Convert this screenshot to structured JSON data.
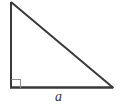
{
  "figure": {
    "name": "right-triangle",
    "type": "geometry-diagram",
    "background_color": "#ffffff",
    "stroke_color": "#3a3a3a",
    "stroke_width": 2,
    "vertices": {
      "apex_top_left": {
        "x": 11,
        "y": 2
      },
      "right_angle_bottom_left": {
        "x": 11,
        "y": 88
      },
      "bottom_right": {
        "x": 113,
        "y": 88
      }
    },
    "edges": [
      {
        "name": "vertical-leg",
        "from": "apex_top_left",
        "to": "right_angle_bottom_left",
        "label": ""
      },
      {
        "name": "horizontal-leg",
        "from": "right_angle_bottom_left",
        "to": "bottom_right",
        "label": "a"
      },
      {
        "name": "hypotenuse",
        "from": "apex_top_left",
        "to": "bottom_right",
        "label": ""
      }
    ],
    "right_angle_marker": {
      "name": "right-angle-square",
      "vertex": "right_angle_bottom_left",
      "size": 9,
      "stroke_color": "#8a8a8a",
      "stroke_width": 1
    },
    "labels": {
      "base": "a"
    }
  }
}
